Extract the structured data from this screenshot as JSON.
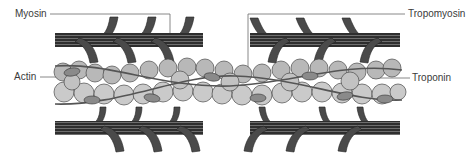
{
  "diagram": {
    "labels": {
      "myosin": "Myosin",
      "tropomyosin": "Tropomyosin",
      "actin": "Actin",
      "troponin": "Troponin"
    },
    "colors": {
      "myosin_fill": "#3c3c3c",
      "myosin_head": "#4a4a4a",
      "actin_bead": "#c9c9c9",
      "actin_bead_dark": "#b4b4b4",
      "bead_outline": "#4a4a4a",
      "tropomyosin_strand": "#5a5a5a",
      "troponin": "#8a8a8a",
      "leader_line": "#6a6a6a",
      "label_text": "#3a3a3a",
      "background": "#ffffff"
    }
  }
}
